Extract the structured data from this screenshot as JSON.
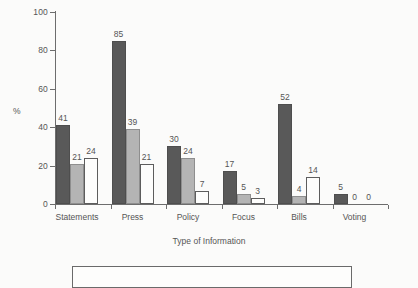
{
  "chart_data": {
    "type": "bar",
    "title": "",
    "subtitle": "",
    "xlabel": "Type of Information",
    "ylabel": "%",
    "ylim": [
      0,
      100
    ],
    "ytick_values": [
      0,
      20,
      40,
      60,
      80,
      100
    ],
    "ytick_labels": [
      "0",
      "20",
      "40",
      "60",
      "80",
      "100"
    ],
    "grid": false,
    "legend_position": "bottom",
    "legend_visible_entries": [],
    "categories": [
      "Statements",
      "Press",
      "Policy",
      "Focus",
      "Bills",
      "Voting"
    ],
    "series": [
      {
        "name": "series-1",
        "color": "#595959",
        "values": [
          41,
          85,
          30,
          17,
          52,
          5
        ],
        "labels": [
          "41",
          "85",
          "30",
          "17",
          "52",
          "5"
        ]
      },
      {
        "name": "series-2",
        "color": "#b4b4b4",
        "values": [
          21,
          39,
          24,
          5,
          4,
          0
        ],
        "labels": [
          "21",
          "39",
          "24",
          "5",
          "4",
          "0"
        ]
      },
      {
        "name": "series-3",
        "color": "#fdfdfc",
        "values": [
          24,
          21,
          7,
          3,
          14,
          0
        ],
        "labels": [
          "24",
          "21",
          "7",
          "3",
          "14",
          "0"
        ]
      }
    ]
  },
  "figure": {
    "background_color": "#fbfbfa",
    "axis_color": "#6d6d6d",
    "text_color": "#555555",
    "legend_border_color": "#6a6a6a"
  }
}
